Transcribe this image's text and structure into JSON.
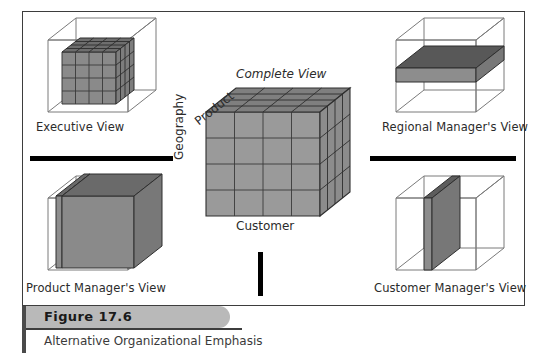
{
  "figure": {
    "number_label": "Figure 17.6",
    "caption": "Alternative Organizational Emphasis"
  },
  "center": {
    "title": "Complete View",
    "axis_top": "Product",
    "axis_left": "Geography",
    "axis_bottom": "Customer"
  },
  "views": [
    {
      "id": "executive",
      "label": "Executive View",
      "emphasis": "inner-core-cube"
    },
    {
      "id": "regional-manager",
      "label": "Regional Manager's View",
      "emphasis": "horizontal-slab"
    },
    {
      "id": "product-manager",
      "label": "Product Manager's View",
      "emphasis": "front-face-slab"
    },
    {
      "id": "customer-manager",
      "label": "Customer Manager's View",
      "emphasis": "vertical-slab"
    }
  ],
  "dividers": {
    "left_bar": "horizontal-rule",
    "right_bar": "horizontal-rule",
    "center_bar": "vertical-rule"
  },
  "colors": {
    "frame": "#3d3d3d",
    "cube_front": "#9a9a9a",
    "cube_top": "#828282",
    "cube_side": "#8c8c8c",
    "slab_dark": "#6b6b6b",
    "wire": "#7a7a7a",
    "bar": "#000000",
    "banner": "#b9b9b9"
  },
  "grid": {
    "divisions": 4
  }
}
